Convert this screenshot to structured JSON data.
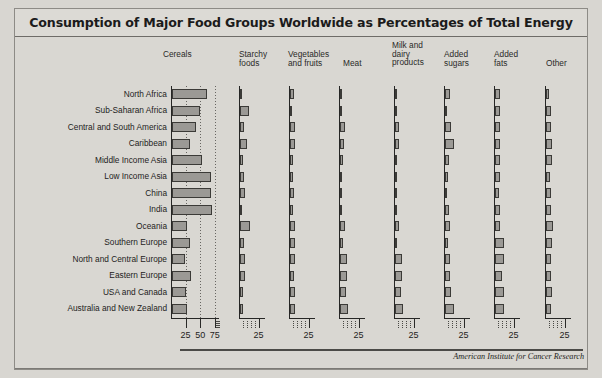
{
  "figure": {
    "title": "Consumption of Major Food Groups Worldwide as Percentages of Total Energy",
    "credit": "American Institute for Cancer Research"
  },
  "chart_data": {
    "type": "bar",
    "orientation": "horizontal",
    "title": "Consumption of Major Food Groups Worldwide as Percentages of Total Energy",
    "xlabel": "",
    "ylabel": "",
    "grid": true,
    "legend": "none",
    "note": "Small-multiples panel of horizontal bar charts; one panel per food group, sharing the same region rows. Values are percentages of total dietary energy.",
    "categories": [
      "North Africa",
      "Sub-Saharan Africa",
      "Central and South America",
      "Caribbean",
      "Middle Income Asia",
      "Low Income Asia",
      "China",
      "India",
      "Oceania",
      "Southern Europe",
      "North and Central Europe",
      "Eastern Europe",
      "USA and Canada",
      "Australia and New Zealand"
    ],
    "panels": [
      {
        "name": "Cereals",
        "label": "Cereals",
        "xlim": [
          0,
          82
        ],
        "ticks": [
          25,
          50,
          75
        ],
        "tick_labels": [
          "25",
          "50",
          "75"
        ],
        "values": [
          59,
          48,
          41,
          30,
          52,
          67,
          66,
          68,
          26,
          30,
          23,
          33,
          24,
          26
        ]
      },
      {
        "name": "Starchy foods",
        "label": "Starchy\nfoods",
        "xlim": [
          0,
          33
        ],
        "ticks": [
          25
        ],
        "tick_labels": [
          "25"
        ],
        "values": [
          2,
          11,
          5,
          9,
          4,
          5,
          7,
          3,
          13,
          5,
          6,
          6,
          4,
          4
        ]
      },
      {
        "name": "Vegetables and fruits",
        "label": "Vegetables\nand fruits",
        "xlim": [
          0,
          33
        ],
        "ticks": [
          25
        ],
        "tick_labels": [
          "25"
        ],
        "values": [
          5,
          2,
          6,
          6,
          4,
          4,
          5,
          4,
          7,
          6,
          6,
          5,
          6,
          6
        ]
      },
      {
        "name": "Meat",
        "label": "Meat",
        "xlim": [
          0,
          33
        ],
        "ticks": [
          25
        ],
        "tick_labels": [
          "25"
        ],
        "values": [
          2,
          3,
          6,
          5,
          4,
          2,
          1,
          1,
          6,
          4,
          9,
          9,
          8,
          10
        ]
      },
      {
        "name": "Milk and dairy products",
        "label": "Milk and\ndairy\nproducts",
        "xlim": [
          0,
          33
        ],
        "ticks": [
          25
        ],
        "tick_labels": [
          "25"
        ],
        "values": [
          3,
          2,
          5,
          5,
          2,
          2,
          1,
          2,
          5,
          2,
          9,
          9,
          8,
          10
        ]
      },
      {
        "name": "Added sugars",
        "label": "Added\nsugars",
        "xlim": [
          0,
          33
        ],
        "ticks": [
          25
        ],
        "tick_labels": [
          "25"
        ],
        "values": [
          6,
          3,
          8,
          11,
          5,
          4,
          2,
          5,
          7,
          4,
          7,
          7,
          8,
          11
        ]
      },
      {
        "name": "Added fats",
        "label": "Added\nfats",
        "xlim": [
          0,
          33
        ],
        "ticks": [
          25
        ],
        "tick_labels": [
          "25"
        ],
        "values": [
          7,
          6,
          7,
          7,
          6,
          6,
          5,
          7,
          6,
          11,
          11,
          9,
          12,
          11
        ]
      },
      {
        "name": "Other",
        "label": "Other",
        "xlim": [
          0,
          33
        ],
        "ticks": [
          25
        ],
        "tick_labels": [
          "25"
        ],
        "values": [
          4,
          7,
          7,
          8,
          8,
          5,
          6,
          7,
          9,
          8,
          7,
          6,
          8,
          7
        ]
      }
    ]
  }
}
